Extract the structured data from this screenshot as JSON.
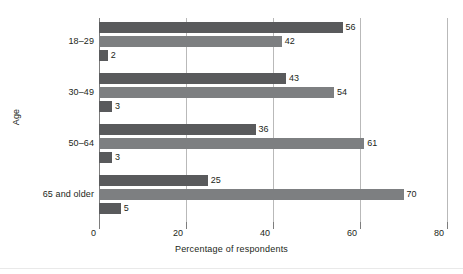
{
  "chart_data": {
    "type": "bar",
    "orientation": "horizontal",
    "title": "",
    "xlabel": "Percentage of respondents",
    "ylabel": "Age",
    "categories": [
      "18–29",
      "30–49",
      "50–64",
      "65 and older"
    ],
    "series": [
      {
        "name": "series-1",
        "color": "#595a5c",
        "values": [
          56,
          43,
          36,
          25
        ]
      },
      {
        "name": "series-2",
        "color": "#7d7f81",
        "values": [
          42,
          54,
          61,
          70
        ]
      },
      {
        "name": "series-3",
        "color": "#595a5c",
        "values": [
          2,
          3,
          3,
          5
        ]
      }
    ],
    "xlim": [
      0,
      80
    ],
    "xticks": [
      0,
      20,
      40,
      60,
      80
    ],
    "xtick_labels": [
      "0",
      "20",
      "40",
      "60",
      "80"
    ],
    "grid": true,
    "grid_axis": "x",
    "legend": "none",
    "data_labels": true
  },
  "colors": {
    "bar_dark": "#595a5c",
    "bar_light": "#7d7f81",
    "gridline": "#b9b9b9",
    "axis": "#7d7d7d",
    "text": "#231f20",
    "background": "#ffffff"
  }
}
